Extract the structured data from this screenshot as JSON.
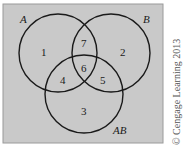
{
  "diagram": {
    "type": "venn",
    "background_color": "#c9c9c9",
    "line_color": "#1a1a1a",
    "sets": [
      {
        "id": "A",
        "label": "A"
      },
      {
        "id": "B",
        "label": "B"
      },
      {
        "id": "AB",
        "label": "AB"
      }
    ],
    "regions": [
      {
        "id": "only-A",
        "label": "1"
      },
      {
        "id": "only-B",
        "label": "2"
      },
      {
        "id": "only-AB",
        "label": "3"
      },
      {
        "id": "A-and-AB",
        "label": "4"
      },
      {
        "id": "B-and-AB",
        "label": "5"
      },
      {
        "id": "all-three",
        "label": "6"
      },
      {
        "id": "A-and-B",
        "label": "7"
      }
    ],
    "copyright": "© Cengage Learning 2013"
  }
}
